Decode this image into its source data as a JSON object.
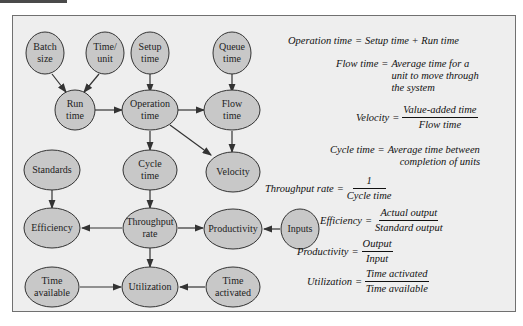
{
  "diagram": {
    "type": "flow-diagram",
    "colors": {
      "node_fill": "#c8c8c8",
      "node_stroke": "#333333",
      "panel_bg": "#eeeeee",
      "arrow": "#333333"
    },
    "nodes": [
      {
        "id": "batch_size",
        "lines": [
          "Batch",
          "size"
        ]
      },
      {
        "id": "time_unit",
        "lines": [
          "Time/",
          "unit"
        ]
      },
      {
        "id": "setup_time",
        "lines": [
          "Setup",
          "time"
        ]
      },
      {
        "id": "queue_time",
        "lines": [
          "Queue",
          "time"
        ]
      },
      {
        "id": "run_time",
        "lines": [
          "Run",
          "time"
        ]
      },
      {
        "id": "operation_time",
        "lines": [
          "Operation",
          "time"
        ]
      },
      {
        "id": "flow_time",
        "lines": [
          "Flow",
          "time"
        ]
      },
      {
        "id": "standards",
        "lines": [
          "Standards"
        ]
      },
      {
        "id": "cycle_time",
        "lines": [
          "Cycle",
          "time"
        ]
      },
      {
        "id": "velocity",
        "lines": [
          "Velocity"
        ]
      },
      {
        "id": "efficiency",
        "lines": [
          "Efficiency"
        ]
      },
      {
        "id": "throughput_rate",
        "lines": [
          "Throughput",
          "rate"
        ]
      },
      {
        "id": "productivity",
        "lines": [
          "Productivity"
        ]
      },
      {
        "id": "inputs",
        "lines": [
          "Inputs"
        ]
      },
      {
        "id": "time_available",
        "lines": [
          "Time",
          "available"
        ]
      },
      {
        "id": "utilization",
        "lines": [
          "Utilization"
        ]
      },
      {
        "id": "time_activated",
        "lines": [
          "Time",
          "activated"
        ]
      }
    ],
    "edges": [
      [
        "batch_size",
        "run_time"
      ],
      [
        "time_unit",
        "run_time"
      ],
      [
        "setup_time",
        "operation_time"
      ],
      [
        "run_time",
        "operation_time"
      ],
      [
        "queue_time",
        "flow_time"
      ],
      [
        "operation_time",
        "flow_time"
      ],
      [
        "operation_time",
        "cycle_time"
      ],
      [
        "operation_time",
        "velocity"
      ],
      [
        "flow_time",
        "velocity"
      ],
      [
        "standards",
        "efficiency"
      ],
      [
        "cycle_time",
        "throughput_rate"
      ],
      [
        "throughput_rate",
        "efficiency"
      ],
      [
        "throughput_rate",
        "productivity"
      ],
      [
        "inputs",
        "productivity"
      ],
      [
        "throughput_rate",
        "utilization"
      ],
      [
        "time_available",
        "utilization"
      ],
      [
        "time_activated",
        "utilization"
      ]
    ]
  },
  "formulas": [
    {
      "lhs": "Operation time",
      "rhs": "Setup time + Run time"
    },
    {
      "lhs": "Flow time",
      "rhs_lines": [
        "Average time for a",
        "unit to move through",
        "the system"
      ]
    },
    {
      "lhs": "Velocity",
      "numerator": "Value-added time",
      "denominator": "Flow time"
    },
    {
      "lhs": "Cycle time",
      "rhs_lines": [
        "Average time between",
        "completion of units"
      ]
    },
    {
      "lhs": "Throughput rate",
      "numerator": "1",
      "denominator": "Cycle time"
    },
    {
      "lhs": "Efficiency",
      "numerator": "Actual output",
      "denominator": "Standard output"
    },
    {
      "lhs": "Productivity",
      "numerator": "Output",
      "denominator": "Input"
    },
    {
      "lhs": "Utilization",
      "numerator": "Time activated",
      "denominator": "Time available"
    }
  ],
  "eq": "="
}
